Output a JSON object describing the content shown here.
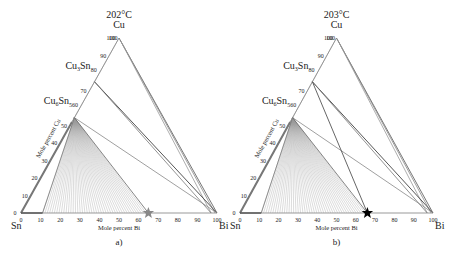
{
  "chart_data": [
    {
      "type": "ternary",
      "panel_label": "a)",
      "title": "202°C",
      "vertices": {
        "top": "Cu",
        "left": "Sn",
        "right": "Bi"
      },
      "phase_labels": [
        "Cu3Sn",
        "Cu6Sn5"
      ],
      "left_axis_label": "Mole percent Cu",
      "bottom_axis_label": "Mole percent Bi",
      "left_ticks": [
        0,
        10,
        20,
        30,
        40,
        50,
        60,
        70,
        80,
        90,
        100
      ],
      "bottom_ticks": [
        0,
        10,
        20,
        30,
        40,
        50,
        60,
        70,
        80,
        90,
        100
      ],
      "marker": {
        "shape": "star",
        "color": "#888888",
        "bi_percent": 65,
        "cu_percent": 0
      }
    },
    {
      "type": "ternary",
      "panel_label": "b)",
      "title": "203°C",
      "vertices": {
        "top": "Cu",
        "left": "Sn",
        "right": "Bi"
      },
      "phase_labels": [
        "Cu3Sn",
        "Cu6Sn5"
      ],
      "left_axis_label": "Mole percent Cu",
      "bottom_axis_label": "Mole percent Bi",
      "left_ticks": [
        0,
        10,
        20,
        30,
        40,
        50,
        60,
        70,
        80,
        90,
        100
      ],
      "bottom_ticks": [
        0,
        10,
        20,
        30,
        40,
        50,
        60,
        70,
        80,
        90,
        100
      ],
      "marker": {
        "shape": "star",
        "color": "#000000",
        "bi_percent": 66,
        "cu_percent": 0
      }
    }
  ],
  "panels": {
    "a": {
      "title": "202°C",
      "cu": "Cu",
      "sn": "Sn",
      "bi": "Bi",
      "cu3sn": "Cu",
      "cu3sn_sub": "3",
      "cu3sn_tail": "Sn",
      "cu6sn5": "Cu",
      "cu6sn5_sub1": "6",
      "cu6sn5_tail": "Sn",
      "cu6sn5_sub2": "5",
      "xlabel": "Mole percent Bi",
      "ylabel": "Mole percent Cu",
      "label": "a)"
    },
    "b": {
      "title": "203°C",
      "cu": "Cu",
      "sn": "Sn",
      "bi": "Bi",
      "cu3sn": "Cu",
      "cu3sn_sub": "3",
      "cu3sn_tail": "Sn",
      "cu6sn5": "Cu",
      "cu6sn5_sub1": "6",
      "cu6sn5_tail": "Sn",
      "cu6sn5_sub2": "5",
      "xlabel": "Mole percent Bi",
      "ylabel": "Mole percent Cu",
      "label": "b)"
    }
  }
}
